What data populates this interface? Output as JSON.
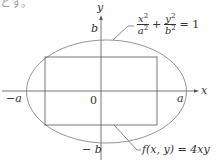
{
  "top_fragment": "とす。",
  "axes": {
    "x_label": "x",
    "y_label": "y",
    "origin_label": "0"
  },
  "ticks": {
    "a_pos": "a",
    "a_neg": "−a",
    "b_pos": "b",
    "b_neg": "− b"
  },
  "ellipse_label": {
    "num1": "x",
    "den1": "a",
    "exp": "2",
    "plus": "+",
    "num2": "y",
    "den2": "b",
    "equals": "= 1"
  },
  "rect_label": "f(x, y) = 4xy",
  "colors": {
    "line": "#555555",
    "ellipse": "#777777",
    "text": "#333333"
  }
}
